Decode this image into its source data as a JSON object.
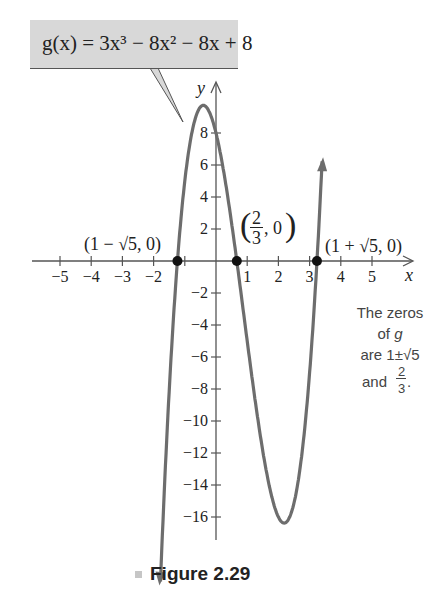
{
  "callout": {
    "label": "g(x) = 3x³ − 8x² − 8x + 8"
  },
  "axes": {
    "x_label": "x",
    "y_label": "y"
  },
  "zero_labels": {
    "left": "(1 − √5, 0)",
    "middle_num": "2",
    "middle_den": "3",
    "middle_rest": ", 0",
    "right": "(1 + √5, 0)"
  },
  "note": {
    "line1": "The zeros",
    "line2": "of g",
    "line3": "are 1±√5",
    "line4_prefix": "and",
    "line4_num": "2",
    "line4_den": "3"
  },
  "caption": {
    "label": "Figure 2.29"
  },
  "chart_data": {
    "type": "line",
    "title": "",
    "function": "g(x) = 3x^3 - 8x^2 - 8x + 8",
    "xlabel": "x",
    "ylabel": "y",
    "xlim": [
      -5.5,
      6
    ],
    "ylim": [
      -18,
      10
    ],
    "x_ticks": [
      -5,
      -4,
      -3,
      -2,
      1,
      2,
      3,
      4,
      5
    ],
    "y_ticks": [
      -16,
      -14,
      -12,
      -10,
      -8,
      -6,
      -4,
      -2,
      2,
      4,
      6,
      8
    ],
    "grid": false,
    "legend": null,
    "series": [
      {
        "name": "g(x)",
        "x": [
          -1.8,
          -1.5,
          -1.236,
          -1.0,
          -0.5,
          -0.43,
          0,
          0.5,
          0.667,
          1.0,
          1.5,
          2.0,
          2.21,
          2.5,
          3.0,
          3.236,
          3.5,
          3.75
        ],
        "values": [
          -12.9,
          -3.0,
          0,
          5.0,
          9.6,
          9.7,
          8.0,
          2.4,
          0,
          -5.0,
          -11.9,
          -16.0,
          -16.4,
          -15.1,
          -7.0,
          0,
          11.6,
          22.7
        ]
      }
    ],
    "points": [
      {
        "label": "(1 − √5, 0)",
        "x": -1.236,
        "y": 0
      },
      {
        "label": "(2/3, 0)",
        "x": 0.667,
        "y": 0
      },
      {
        "label": "(1 + √5, 0)",
        "x": 3.236,
        "y": 0
      }
    ],
    "annotations": [
      "g(x) = 3x^3 − 8x^2 − 8x + 8",
      "The zeros of g are 1±√5 and 2/3."
    ],
    "caption": "Figure 2.29"
  }
}
